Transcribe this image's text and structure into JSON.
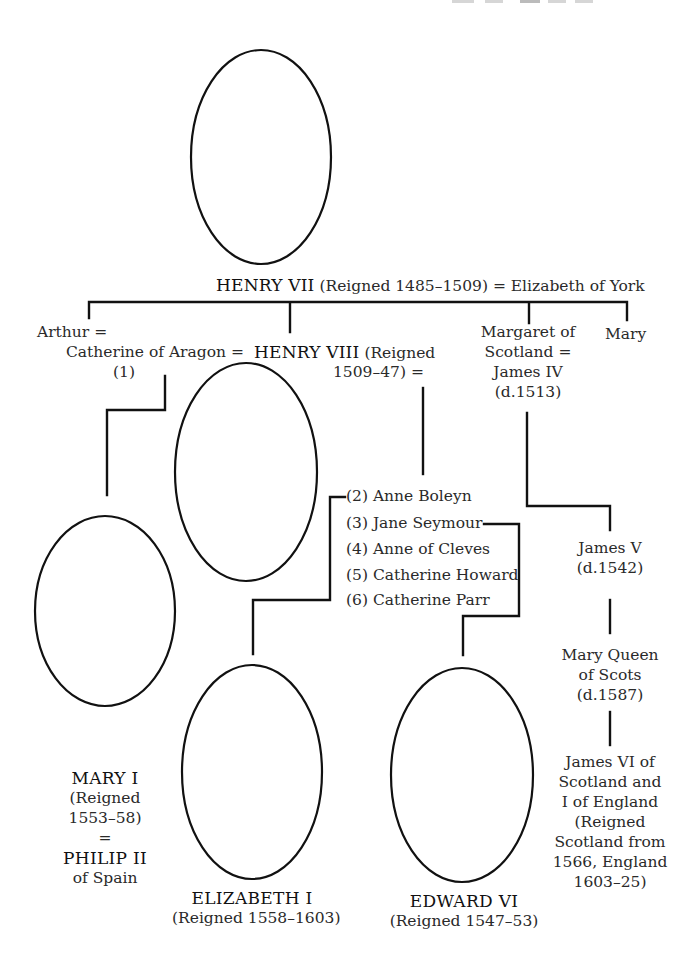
{
  "root": {
    "name": "HENRY VII",
    "detail": "(Reigned 1485–1509)",
    "spouse": "= Elizabeth of York"
  },
  "children": {
    "arthur": "Arthur =",
    "catherine": "Catherine of Aragon =",
    "catherine_number": "(1)",
    "henry8_name": "HENRY VIII",
    "henry8_detail_1": "(Reigned",
    "henry8_detail_2": "1509–47) =",
    "margaret_lines": [
      "Margaret of",
      "Scotland =",
      "James IV",
      "(d.1513)"
    ],
    "mary": "Mary"
  },
  "wives": [
    "(2) Anne Boleyn",
    "(3) Jane Seymour",
    "(4) Anne of Cleves",
    "(5) Catherine Howard",
    "(6) Catherine Parr"
  ],
  "scottish_line": {
    "james5": [
      "James V",
      "(d.1542)"
    ],
    "mary_qos": [
      "Mary Queen",
      "of Scots",
      "(d.1587)"
    ],
    "james6": [
      "James VI of",
      "Scotland and",
      "I of England",
      "(Reigned",
      "Scotland from",
      "1566, England",
      "1603–25)"
    ]
  },
  "monarchs": {
    "mary1": {
      "name": "MARY I",
      "lines": [
        "(Reigned",
        "1553–58)",
        "="
      ],
      "spouse_name": "PHILIP II",
      "spouse_detail": "of Spain"
    },
    "elizabeth1": {
      "name": "ELIZABETH I",
      "detail": "(Reigned 1558–1603)"
    },
    "edward6": {
      "name": "EDWARD VI",
      "detail": "(Reigned 1547–53)"
    }
  },
  "portraits": [
    {
      "id": "henry7",
      "label": "portrait-henry-vii"
    },
    {
      "id": "henry8",
      "label": "portrait-henry-viii"
    },
    {
      "id": "mary1",
      "label": "portrait-mary-i"
    },
    {
      "id": "elizabeth1",
      "label": "portrait-elizabeth-i"
    },
    {
      "id": "edward6",
      "label": "portrait-edward-vi"
    }
  ]
}
